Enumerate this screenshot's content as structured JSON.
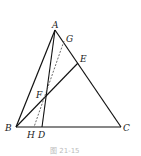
{
  "diagram": {
    "type": "geometry",
    "shape": "triangle",
    "points": {
      "A": {
        "label": "A",
        "x": 55,
        "y": 30
      },
      "B": {
        "label": "B",
        "x": 16,
        "y": 127
      },
      "C": {
        "label": "C",
        "x": 121,
        "y": 127
      },
      "D": {
        "label": "D",
        "x": 42,
        "y": 127
      },
      "E": {
        "label": "E",
        "x": 78,
        "y": 63
      },
      "F": {
        "label": "F",
        "x": 44,
        "y": 96
      },
      "G": {
        "label": "G",
        "x": 64,
        "y": 41
      },
      "H": {
        "label": "H",
        "x": 34,
        "y": 127
      }
    },
    "solid_segments": [
      "AB",
      "BC",
      "CA",
      "AD",
      "BE"
    ],
    "dashed_segments": [
      "GH"
    ],
    "caption": "图 21-15"
  }
}
